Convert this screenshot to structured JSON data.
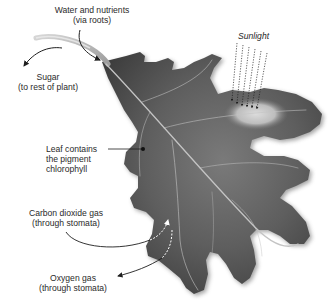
{
  "diagram": {
    "labels": {
      "water": {
        "line1": "Water and nutrients",
        "line2": "(via roots)"
      },
      "sugar": {
        "line1": "Sugar",
        "line2": "(to rest of plant)"
      },
      "sunlight": {
        "text": "Sunlight"
      },
      "chlorophyll": {
        "line1": "Leaf contains",
        "line2": "the pigment",
        "line3": "chlorophyll"
      },
      "carbon_dioxide": {
        "line1": "Carbon dioxide gas",
        "line2": "(through stomata)"
      },
      "oxygen": {
        "line1": "Oxygen gas",
        "line2": "(through stomata)"
      }
    },
    "colors": {
      "leaf_dark": "#4a4a4a",
      "leaf_mid": "#6e6e6e",
      "leaf_light": "#8a8a8a",
      "vein": "#c8c8c8",
      "stem": "#b5b5b5",
      "arrow": "#1e1e1e",
      "text": "#2a2a2a",
      "background": "#ffffff"
    }
  }
}
